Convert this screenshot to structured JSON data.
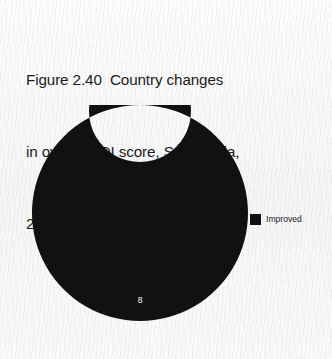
{
  "title": {
    "line1": "Figure 2.40  Country changes",
    "line2": "in overall YDI score, South Asia,",
    "line3": "2010–2018"
  },
  "legend": {
    "items": [
      {
        "label": "Improved",
        "color": "#111111"
      }
    ]
  },
  "chart_data": {
    "type": "pie",
    "variant": "donut",
    "title": "Figure 2.40  Country changes in overall YDI score, South Asia, 2010–2018",
    "categories": [
      "Improved"
    ],
    "values": [
      8
    ],
    "value_labels": [
      "8"
    ],
    "colors": [
      "#111111"
    ],
    "total": 8,
    "legend_position": "right",
    "hole_ratio": 0.47,
    "start_angle": 90,
    "grid": false,
    "xlabel": "",
    "ylabel": ""
  },
  "geometry": {
    "outer_radius": 108,
    "inner_radius": 51,
    "center_x": 108,
    "center_y": 108,
    "label_radius": 87
  }
}
